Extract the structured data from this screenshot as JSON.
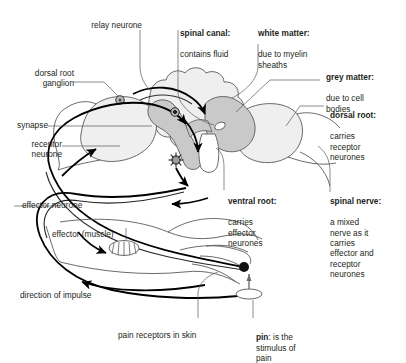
{
  "diagram": {
    "colors": {
      "grey_matter": "#c9c9c9",
      "white_matter": "#efefef",
      "outline": "#58595b",
      "neuron_line": "#000000",
      "text": "#231f20"
    }
  },
  "labels": {
    "relay_neurone": {
      "text": "relay neurone",
      "bold": ""
    },
    "dorsal_root_ganglion": {
      "text": "dorsal root\nganglion"
    },
    "synapse": {
      "text": "synapse"
    },
    "receptor_neurone": {
      "text": "receptor\nneurone"
    },
    "effector_neurone": {
      "text": "effector neurone"
    },
    "effector_muscle": {
      "text": "effector (muscle)"
    },
    "direction_of_impulse": {
      "text": "direction of impulse"
    },
    "pain_receptors": {
      "text": "pain receptors in skin"
    },
    "spinal_canal": {
      "bold": "spinal canal:",
      "text": "contains fluid"
    },
    "white_matter": {
      "bold": "white matter:",
      "text": "due to myelin\nsheaths"
    },
    "grey_matter": {
      "bold": "grey matter:",
      "text": "due to cell\nbodies"
    },
    "dorsal_root": {
      "bold": "dorsal root:",
      "text": "carries\nreceptor\nneurones"
    },
    "spinal_nerve": {
      "bold": "spinal nerve:",
      "text": "a mixed\nnerve as it\ncarries\neffector and\nreceptor\nneurones"
    },
    "ventral_root": {
      "bold": "ventral root:",
      "text": "carries\neffector\nneurones"
    },
    "pin": {
      "bold": "pin",
      "text": ": is the\nstimulus of\npain"
    }
  }
}
